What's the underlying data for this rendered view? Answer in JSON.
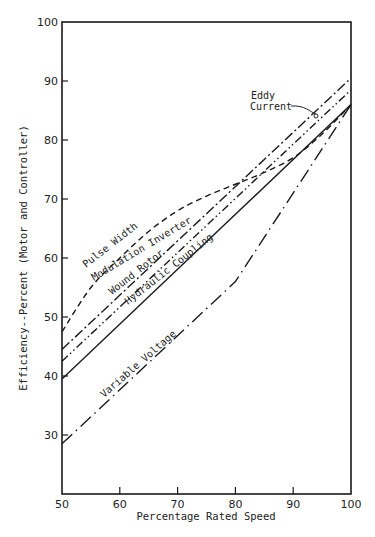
{
  "chart_data": {
    "type": "line",
    "title": "",
    "xlabel": "Percentage Rated Speed",
    "ylabel": "Efficiency--Percent (Motor and Controller)",
    "xlim": [
      50,
      100
    ],
    "ylim": [
      20,
      100
    ],
    "x_ticks": [
      50,
      60,
      70,
      80,
      90,
      100
    ],
    "y_ticks": [
      30,
      40,
      50,
      60,
      70,
      80,
      90,
      100
    ],
    "grid": false,
    "legend": "inline labels on lines",
    "series": [
      {
        "name": "Pulse Width Modulation Inverter",
        "style": "dashed",
        "x": [
          50,
          55,
          60,
          65,
          70,
          75,
          80,
          85,
          90,
          95,
          100
        ],
        "values": [
          47.5,
          55,
          60,
          64.5,
          68,
          70.5,
          72.5,
          74.5,
          77,
          81,
          86
        ]
      },
      {
        "name": "Wound Rotor",
        "style": "long-dash-dot",
        "x": [
          50,
          100
        ],
        "values": [
          44.5,
          90.5
        ]
      },
      {
        "name": "Hydraulic Coupling",
        "style": "dash-dot-dot",
        "x": [
          50,
          100
        ],
        "values": [
          42.5,
          88.5
        ]
      },
      {
        "name": "Eddy Current",
        "style": "solid",
        "x": [
          50,
          100
        ],
        "values": [
          39.5,
          86
        ]
      },
      {
        "name": "Variable Voltage",
        "style": "long-dash-dot-sparse",
        "x": [
          50,
          80,
          100
        ],
        "values": [
          28.5,
          56,
          86
        ]
      }
    ],
    "annotations": [
      {
        "text": "Eddy Current",
        "type": "callout-arrow",
        "points_to": [
          94,
          83
        ]
      }
    ]
  },
  "labels": {
    "pwm_line1": "Pulse Width",
    "pwm_line2": "Modulation Inverter",
    "wound_rotor": "Wound Rotor",
    "hydraulic": "Hydraulic Coupling",
    "variable_voltage": "Variable Voltage",
    "eddy_line1": "Eddy",
    "eddy_line2": "Current"
  }
}
